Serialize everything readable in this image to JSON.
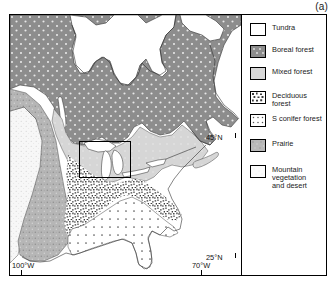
{
  "figure": {
    "panel_label": "(a)",
    "type": "vegetation-zone-map",
    "region": "Eastern North America"
  },
  "legend": {
    "items": [
      {
        "label": "Tundra",
        "pattern": "blank-white",
        "color": "#ffffff"
      },
      {
        "label": "Boreal forest",
        "pattern": "dark-dotted",
        "color": "#8a8a8a"
      },
      {
        "label": "Mixed forest",
        "pattern": "light-solid",
        "color": "#d8d8d8"
      },
      {
        "label": "Deciduous\nforest",
        "pattern": "dense-speckle",
        "color": "#6e6e6e"
      },
      {
        "label": "S conifer forest",
        "pattern": "sparse-dot-grid",
        "color": "#fafafa"
      },
      {
        "label": "Prairie",
        "pattern": "medium-stipple",
        "color": "#b4b4b4"
      },
      {
        "label": "Mountain\nvegetation\nand desert",
        "pattern": "fine-stipple",
        "color": "#f2f2f2"
      }
    ]
  },
  "axes": {
    "lat_ticks": [
      {
        "label": "45°N"
      },
      {
        "label": "25°N"
      }
    ],
    "lon_ticks": [
      {
        "label": "100°W"
      },
      {
        "label": "70°W"
      }
    ]
  },
  "map_features": {
    "inset_rectangle": {
      "description": "study-area box over Great Lakes region"
    },
    "zones": [
      "Tundra",
      "Boreal forest",
      "Mixed forest",
      "Deciduous forest",
      "S conifer forest",
      "Prairie",
      "Mountain vegetation and desert"
    ]
  }
}
